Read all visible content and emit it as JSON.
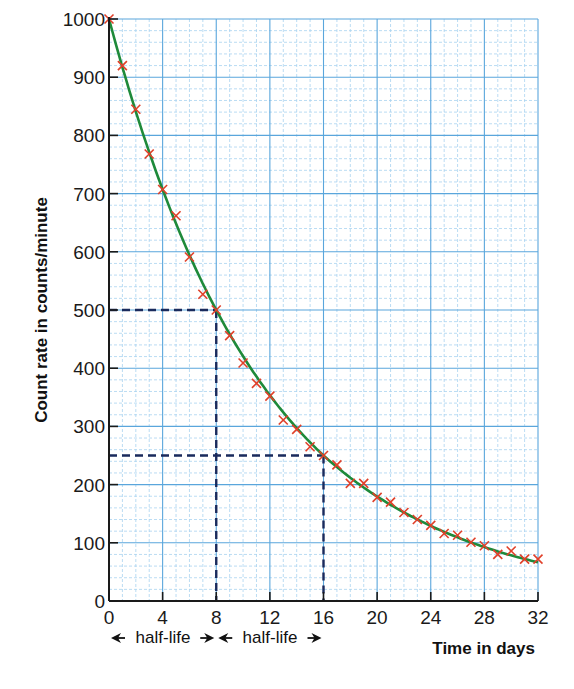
{
  "chart_data": {
    "type": "scatter",
    "title": "",
    "xlabel": "Time in days",
    "ylabel": "Count rate in counts/minute",
    "xlim": [
      0,
      32
    ],
    "ylim": [
      0,
      1000
    ],
    "x_ticks": [
      0,
      4,
      8,
      12,
      16,
      20,
      24,
      28,
      32
    ],
    "y_ticks": [
      0,
      100,
      200,
      300,
      400,
      500,
      600,
      700,
      800,
      900,
      1000
    ],
    "grid": true,
    "legend": null,
    "series": [
      {
        "name": "Measured count rate",
        "marker": "x",
        "color": "#e0402a",
        "x": [
          0,
          1,
          2,
          3,
          4,
          5,
          6,
          7,
          8,
          9,
          10,
          11,
          12,
          13,
          14,
          15,
          16,
          17,
          18,
          19,
          20,
          21,
          22,
          23,
          24,
          25,
          26,
          27,
          28,
          29,
          30,
          31,
          32
        ],
        "values": [
          1000,
          920,
          845,
          768,
          707,
          662,
          591,
          527,
          500,
          456,
          409,
          374,
          352,
          311,
          295,
          265,
          250,
          234,
          202,
          202,
          178,
          170,
          152,
          140,
          130,
          116,
          113,
          101,
          95,
          80,
          86,
          72,
          72
        ]
      },
      {
        "name": "Best-fit decay curve",
        "line": "smooth",
        "color": "#1e8a3a",
        "function": "1000 * 0.5^(t/8)"
      }
    ],
    "annotations": [
      {
        "type": "dashed-line",
        "from": [
          0,
          500
        ],
        "to": [
          8,
          500
        ]
      },
      {
        "type": "dashed-line",
        "from": [
          8,
          500
        ],
        "to": [
          8,
          0
        ]
      },
      {
        "type": "dashed-line",
        "from": [
          0,
          250
        ],
        "to": [
          16,
          250
        ]
      },
      {
        "type": "dashed-line",
        "from": [
          16,
          250
        ],
        "to": [
          16,
          0
        ]
      },
      {
        "type": "span-arrow",
        "from": 0,
        "to": 8,
        "label": "half-life"
      },
      {
        "type": "span-arrow",
        "from": 8,
        "to": 16,
        "label": "half-life"
      }
    ],
    "colors": {
      "grid_major": "#5aa6dc",
      "grid_minor": "#a9d3f0",
      "axis": "#1a1a1a",
      "dashed": "#1a2a5c",
      "curve": "#1e8a3a",
      "marker": "#e0402a"
    }
  },
  "labels": {
    "xlabel": "Time in days",
    "ylabel": "Count rate in counts/minute",
    "half_life_1": "half-life",
    "half_life_2": "half-life"
  }
}
